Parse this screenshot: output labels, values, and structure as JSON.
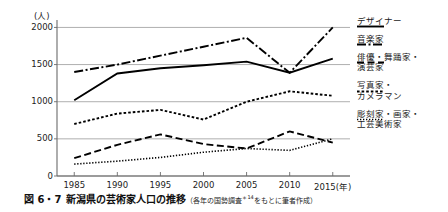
{
  "caption": {
    "figure_number": "図 6・7",
    "title": "新潟県の芸術家人口の推移",
    "source": "（各年の国勢調査",
    "source_mark": "＊14",
    "source_tail": "をもとに筆者作成）"
  },
  "chart_data": {
    "type": "line",
    "title": "新潟県の芸術家人口の推移",
    "xlabel": "(年)",
    "ylabel": "(人)",
    "yunit": "(人)",
    "x": [
      1985,
      1990,
      1995,
      2000,
      2005,
      2010,
      2015
    ],
    "xtick_labels": [
      "1985",
      "1990",
      "1995",
      "2000",
      "2005",
      "2010",
      "2015(年)"
    ],
    "ytick_labels": [
      "0",
      "500",
      "1000",
      "1500",
      "2000"
    ],
    "yticks": [
      0,
      500,
      1000,
      1500,
      2000
    ],
    "ylim": [
      0,
      2100
    ],
    "xlim": [
      1983,
      2017
    ],
    "grid": true,
    "legend_position": "right",
    "series": [
      {
        "name": "デザイナー",
        "label": "デザイナー",
        "style": "solid",
        "color": "#000000",
        "values": [
          1020,
          1380,
          1450,
          1490,
          1540,
          1390,
          1580
        ]
      },
      {
        "name": "音楽家",
        "label": "音楽家",
        "style": "dashdot",
        "color": "#000000",
        "values": [
          1400,
          1500,
          1620,
          1740,
          1860,
          1390,
          2000
        ]
      },
      {
        "name": "俳優・舞踊家・演芸家",
        "label": "俳優・舞踊家・\n演芸家",
        "style": "dashed",
        "color": "#000000",
        "values": [
          240,
          420,
          560,
          430,
          370,
          600,
          450
        ]
      },
      {
        "name": "写真家・カメラマン",
        "label": "写真家・\nカメラマン",
        "style": "dotted-medium",
        "color": "#000000",
        "values": [
          700,
          840,
          890,
          760,
          1000,
          1140,
          1080
        ]
      },
      {
        "name": "彫刻家・画家・工芸美術家",
        "label": "彫刻家・画家・\n工芸美術家",
        "style": "dotted-fine",
        "color": "#000000",
        "values": [
          160,
          200,
          250,
          320,
          370,
          345,
          500
        ]
      }
    ]
  }
}
